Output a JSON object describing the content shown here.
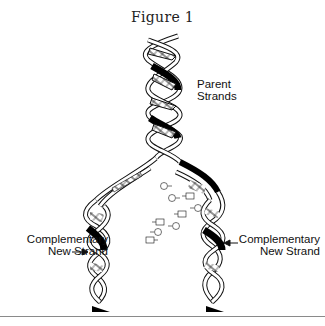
{
  "figure": {
    "title": "Figure 1",
    "labels": {
      "parent": [
        "Parent",
        "Strands"
      ],
      "left_new": [
        "Complementary",
        "New Strand"
      ],
      "right_new": [
        "Complementary",
        "New Strand"
      ]
    },
    "free_nucleotides": [
      "C",
      "A",
      "T",
      "G",
      "A",
      "C",
      "T",
      "G",
      "C",
      "A",
      "T",
      "G"
    ],
    "colors": {
      "strand_outline": "#111111",
      "strand_fill": "#ffffff",
      "shadow": "#000000",
      "rule": "#8a8a8a"
    }
  }
}
